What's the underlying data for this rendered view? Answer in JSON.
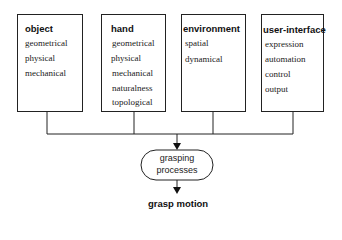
{
  "boxes": [
    {
      "title": "object",
      "items": [
        "geometrical",
        "physical",
        "mechanical"
      ]
    },
    {
      "title": "hand",
      "items": [
        "geometrical",
        "physical",
        "mechanical",
        "naturalness",
        "topological"
      ]
    },
    {
      "title": "environment",
      "items": [
        "spatial",
        "dynamical"
      ]
    },
    {
      "title": "user-interface",
      "items": [
        "expression",
        "automation",
        "control",
        "output"
      ]
    }
  ],
  "process": {
    "line1": "grasping",
    "line2": "processes"
  },
  "output": {
    "label": "grasp motion"
  }
}
